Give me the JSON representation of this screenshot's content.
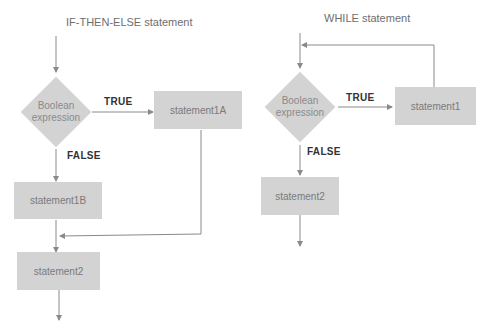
{
  "diagrams": {
    "if_then_else": {
      "title": "IF-THEN-ELSE statement",
      "condition": "Boolean expression",
      "true_label": "TRUE",
      "false_label": "FALSE",
      "true_branch": "statement1A",
      "false_branch": "statement1B",
      "next": "statement2"
    },
    "while": {
      "title": "WHILE statement",
      "condition": "Boolean expression",
      "true_label": "TRUE",
      "false_label": "FALSE",
      "body": "statement1",
      "next": "statement2"
    }
  },
  "colors": {
    "shape_fill": "#d3d3d3",
    "line": "#8a8a8a",
    "label_text": "#333333"
  }
}
